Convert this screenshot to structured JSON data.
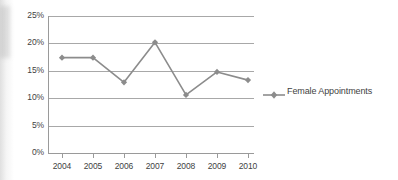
{
  "chart_data": {
    "type": "line",
    "title": "",
    "subtitle": "",
    "xlabel": "",
    "ylabel": "",
    "categories": [
      "2004",
      "2005",
      "2006",
      "2007",
      "2008",
      "2009",
      "2010"
    ],
    "series": [
      {
        "name": "Female Appointments",
        "color": "#8c8c8c",
        "marker": "diamond",
        "values": [
          17.4,
          17.4,
          12.9,
          20.2,
          10.6,
          14.8,
          13.3
        ]
      }
    ],
    "ylim": [
      0,
      25
    ],
    "yticks": [
      0,
      5,
      10,
      15,
      20,
      25
    ],
    "ytick_labels": [
      "0%",
      "5%",
      "10%",
      "15%",
      "20%",
      "25%"
    ],
    "xtick_labels": [
      "2004",
      "2005",
      "2006",
      "2007",
      "2008",
      "2009",
      "2010"
    ],
    "grid": true,
    "grid_axis": "y",
    "legend": [
      "Female Appointments"
    ],
    "legend_position": "right",
    "annotations": []
  },
  "colors": {
    "series": "#8c8c8c",
    "grid": "#a8a8a8",
    "axis": "#9a9a9a",
    "text": "#3f3f3f",
    "background": "#ffffff"
  }
}
